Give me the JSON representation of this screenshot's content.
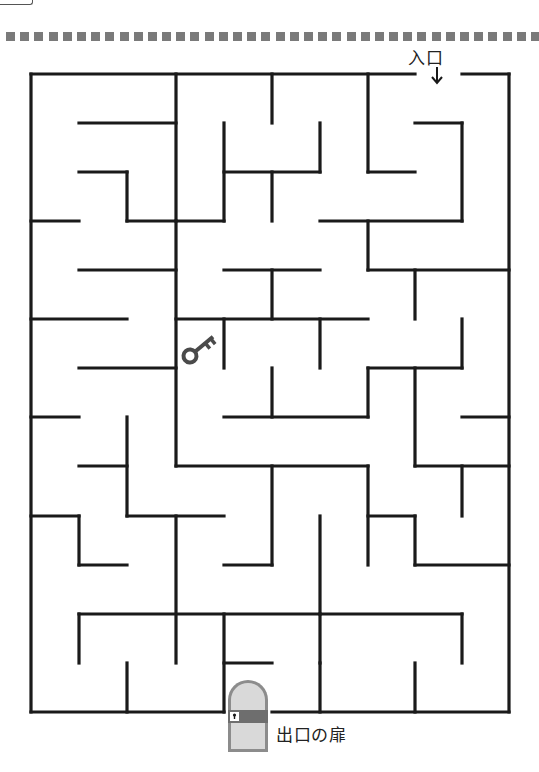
{
  "page": {
    "kind": "maze-puzzle-worksheet"
  },
  "labels": {
    "entrance": "入口",
    "exit": "出口の扉"
  },
  "icons": {
    "entrance_arrow": "down-arrow",
    "key": "key-icon",
    "exit_door": "arched-door-with-keyhole"
  },
  "colors": {
    "wall": "#1a1a1a",
    "dots": "#7a7a7a",
    "door_frame": "#8c8c8c",
    "door_fill": "#d9d9d9",
    "door_band": "#6e6e6e",
    "key": "#4a4a4a"
  },
  "maze": {
    "cols": 10,
    "rows": 13,
    "grid_x": [
      31,
      79,
      127,
      176,
      224,
      272,
      320,
      368,
      415,
      462,
      509
    ],
    "grid_y": [
      74,
      123,
      172,
      221,
      270,
      319,
      368,
      417,
      466,
      516,
      565,
      614,
      663,
      712
    ],
    "entrance": {
      "side": "top",
      "col": 8
    },
    "exit": {
      "side": "bottom",
      "col": 4
    },
    "key_cell": {
      "col": 3,
      "row": 5
    }
  }
}
